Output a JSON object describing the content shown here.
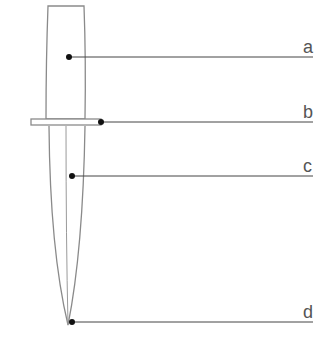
{
  "diagram": {
    "colors": {
      "outline": "#8a8a8a",
      "leader_line": "#444444",
      "dot": "#111111",
      "label": "#555555",
      "background": "#ffffff"
    },
    "labels": [
      {
        "id": "a",
        "text": "a",
        "part": "handle",
        "y": 57
      },
      {
        "id": "b",
        "text": "b",
        "part": "guard",
        "y": 122
      },
      {
        "id": "c",
        "text": "c",
        "part": "blade",
        "y": 176
      },
      {
        "id": "d",
        "text": "d",
        "part": "tip",
        "y": 322
      }
    ]
  }
}
